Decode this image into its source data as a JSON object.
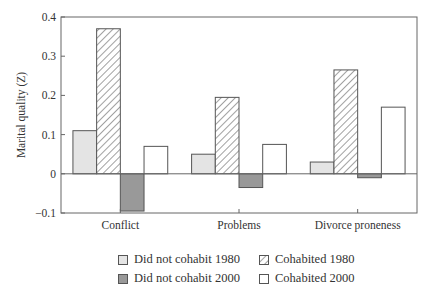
{
  "chart_data": {
    "type": "bar",
    "title": "",
    "xlabel": "",
    "ylabel": "Marital quality (Z)",
    "ylim": [
      -0.1,
      0.4
    ],
    "yticks": [
      -0.1,
      0,
      0.1,
      0.2,
      0.3,
      0.4
    ],
    "ytick_labels": [
      "−0.1",
      "0",
      "0.1",
      "0.2",
      "0.3",
      "0.4"
    ],
    "grid": false,
    "legend_position": "bottom",
    "categories": [
      "Conflict",
      "Problems",
      "Divorce proneness"
    ],
    "series": [
      {
        "name": "Did not cohabit 1980",
        "values": [
          0.11,
          0.05,
          0.03
        ],
        "fill": "#e4e4e4",
        "pattern": "none"
      },
      {
        "name": "Cohabited 1980",
        "values": [
          0.37,
          0.195,
          0.265
        ],
        "fill": "#ffffff",
        "pattern": "diagonal-hatch"
      },
      {
        "name": "Did not cohabit 2000",
        "values": [
          -0.095,
          -0.035,
          -0.01
        ],
        "fill": "#999999",
        "pattern": "none"
      },
      {
        "name": "Cohabited 2000",
        "values": [
          0.07,
          0.075,
          0.17
        ],
        "fill": "#ffffff",
        "pattern": "none"
      }
    ]
  },
  "legend": {
    "items": [
      {
        "label": "Did not cohabit 1980"
      },
      {
        "label": "Cohabited 1980"
      },
      {
        "label": "Did not cohabit 2000"
      },
      {
        "label": "Cohabited 2000"
      }
    ]
  }
}
